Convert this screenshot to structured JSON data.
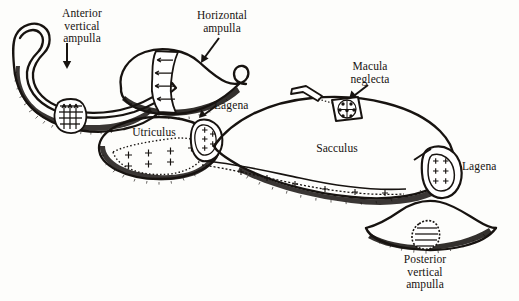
{
  "figure": {
    "width": 519,
    "height": 301,
    "background_color": "#fdfdfb",
    "ink_color": "#171310"
  },
  "labels": {
    "anterior_vertical_ampulla": "Anterior\nvertical\nampulla",
    "horizontal_ampulla": "Horizontal\nampulla",
    "macula_neglecta": "Macula\nneglecta",
    "lagena_utriculus": "Lagena",
    "utriculus": "Utriculus",
    "sacculus": "Sacculus",
    "lagena_sacculus": "Lagena",
    "posterior_vertical_ampulla": "Posterior\nvertical\nampulla"
  },
  "structures": [
    {
      "name": "anterior-vertical-ampulla",
      "label": "Anterior vertical ampulla",
      "has_crista": true
    },
    {
      "name": "horizontal-ampulla",
      "label": "Horizontal ampulla",
      "has_crista": true
    },
    {
      "name": "utriculus",
      "label": "Utriculus",
      "has_macula": true
    },
    {
      "name": "sacculus",
      "label": "Sacculus",
      "has_macula": true
    },
    {
      "name": "macula-neglecta",
      "label": "Macula neglecta",
      "has_macula": true
    },
    {
      "name": "lagena-utriculus",
      "label": "Lagena",
      "has_macula": true
    },
    {
      "name": "lagena-sacculus",
      "label": "Lagena",
      "has_macula": true
    },
    {
      "name": "posterior-vertical-ampulla",
      "label": "Posterior vertical ampulla",
      "has_crista": true
    }
  ],
  "pointers": [
    {
      "name": "pointer-anterior-vertical-ampulla",
      "direction": "down"
    },
    {
      "name": "pointer-horizontal-ampulla",
      "direction": "down-left"
    },
    {
      "name": "pointer-macula-neglecta",
      "direction": "down-left"
    },
    {
      "name": "pointer-lagena-utriculus",
      "direction": "down-left"
    }
  ]
}
